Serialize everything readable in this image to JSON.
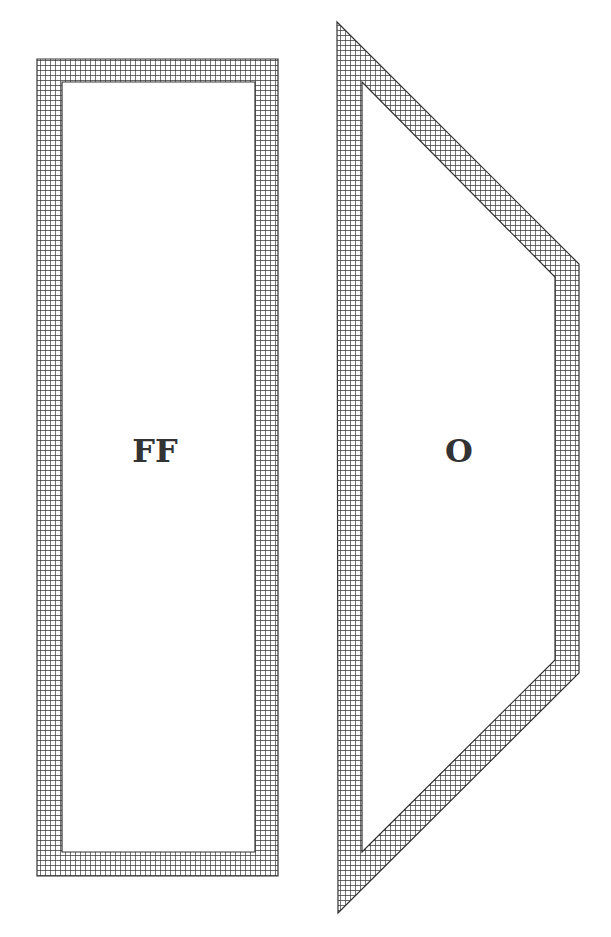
{
  "diagram": {
    "colors": {
      "background": "#ffffff",
      "grid_line": "#3a3a3a",
      "outline": "#333333",
      "label": "#333333"
    },
    "shapes": [
      {
        "id": "left-rectangle",
        "label": "FF",
        "outer": [
          [
            37,
            59
          ],
          [
            278,
            59
          ],
          [
            278,
            876
          ],
          [
            37,
            876
          ]
        ],
        "inner": [
          [
            62,
            82
          ],
          [
            255,
            82
          ],
          [
            255,
            852
          ],
          [
            62,
            852
          ]
        ],
        "label_pos": [
          155,
          462
        ]
      },
      {
        "id": "right-trapezoid",
        "label": "O",
        "outer": [
          [
            337,
            22
          ],
          [
            579,
            264
          ],
          [
            579,
            673
          ],
          [
            338,
            913
          ]
        ],
        "inner": [
          [
            362,
            82
          ],
          [
            555,
            277
          ],
          [
            555,
            660
          ],
          [
            362,
            852
          ]
        ],
        "label_pos": [
          459,
          462
        ]
      }
    ]
  }
}
